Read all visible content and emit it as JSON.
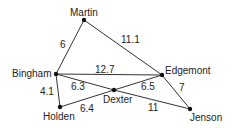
{
  "diagram": {
    "type": "weighted-graph",
    "nodes": [
      {
        "id": "martin",
        "label": "Martin",
        "x": 84,
        "y": 20,
        "lx": 70,
        "ly": 16
      },
      {
        "id": "bingham",
        "label": "Bingham",
        "x": 56,
        "y": 74,
        "lx": 12,
        "ly": 77
      },
      {
        "id": "edgemont",
        "label": "Edgemont",
        "x": 162,
        "y": 75,
        "lx": 165,
        "ly": 74
      },
      {
        "id": "dexter",
        "label": "Dexter",
        "x": 114,
        "y": 90,
        "lx": 103,
        "ly": 103
      },
      {
        "id": "holden",
        "label": "Holden",
        "x": 60,
        "y": 107,
        "lx": 43,
        "ly": 120
      },
      {
        "id": "jenson",
        "label": "Jenson",
        "x": 190,
        "y": 109,
        "lx": 190,
        "ly": 121
      }
    ],
    "edges": [
      {
        "from": "martin",
        "to": "bingham",
        "weight": "6",
        "lx": 60,
        "ly": 48
      },
      {
        "from": "martin",
        "to": "edgemont",
        "weight": "11.1",
        "lx": 121,
        "ly": 43
      },
      {
        "from": "bingham",
        "to": "edgemont",
        "weight": "12.7",
        "lx": 95,
        "ly": 73
      },
      {
        "from": "bingham",
        "to": "dexter",
        "weight": "6.3",
        "lx": 71,
        "ly": 90
      },
      {
        "from": "dexter",
        "to": "jenson",
        "weight": "11",
        "lx": 148,
        "ly": 111
      },
      {
        "from": "bingham",
        "to": "holden",
        "weight": "4.1",
        "lx": 40,
        "ly": 95
      },
      {
        "from": "holden",
        "to": "dexter",
        "weight": "6.4",
        "lx": 80,
        "ly": 112
      },
      {
        "from": "dexter",
        "to": "edgemont",
        "weight": "6.5",
        "lx": 141,
        "ly": 90
      },
      {
        "from": "edgemont",
        "to": "jenson",
        "weight": "7",
        "lx": 179,
        "ly": 91
      }
    ]
  }
}
